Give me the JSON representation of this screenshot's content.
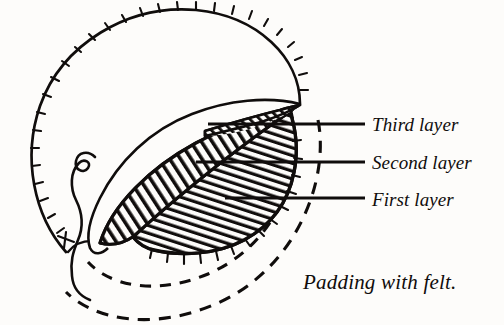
{
  "figure": {
    "title": "Padding with felt.",
    "background_color": "#fdfcfa",
    "ink_color": "#100d0c",
    "labels": [
      {
        "text": "Third layer",
        "x": 372,
        "y": 115,
        "leader": {
          "x1": 208,
          "y1": 124,
          "x2": 365,
          "y2": 124
        }
      },
      {
        "text": "Second layer",
        "x": 372,
        "y": 153,
        "leader": {
          "x1": 196,
          "y1": 162,
          "x2": 365,
          "y2": 162
        }
      },
      {
        "text": "First layer",
        "x": 372,
        "y": 190,
        "leader": {
          "x1": 225,
          "y1": 198,
          "x2": 365,
          "y2": 198
        }
      }
    ],
    "caption": {
      "text": "Padding with felt.",
      "x": 303,
      "y": 272
    },
    "parts": [
      {
        "name": "tick-circle",
        "description": "large circle outline with radial stitch ticks"
      },
      {
        "name": "third-layer",
        "description": "thin hatched sliver at top of padding"
      },
      {
        "name": "second-layer",
        "description": "lens shaped region, diagonal hatching"
      },
      {
        "name": "first-layer",
        "description": "rounded region, steep hatching, ticked edge"
      },
      {
        "name": "thread-squiggle",
        "description": "S shaped thread at left"
      },
      {
        "name": "dashed-arc-inner",
        "description": "inner dashed guide arc"
      },
      {
        "name": "dashed-arc-outer",
        "description": "outer dashed guide arc"
      }
    ]
  }
}
